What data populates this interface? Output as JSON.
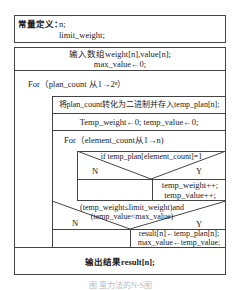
{
  "constants": {
    "label": "常量定义：",
    "line1": "n;",
    "line2": "limit_weight;"
  },
  "main": {
    "input_line1": "输入数组weight[n],value[n];",
    "input_line2": "max_value←0;",
    "outer_loop": "For（plan_count 从1→2ⁿ）",
    "convert": "将plan_count转化为二进制并存入temp_plan[n];",
    "init": "Temp_weight←0; temp_value←0;",
    "inner_loop": "For（element_count从1→n)",
    "cond1": {
      "text": "if temp_plan[element_count]=1",
      "no": "N",
      "yes": "Y",
      "yes_line1": "temp_weight++;",
      "yes_line2": "temp_value++;"
    },
    "cond2": {
      "text_line1": "(temp_weight≤limit_weight)and",
      "text_line2": "(temp_value<max_value)",
      "no": "N",
      "yes": "Y",
      "yes_line1": "result[n]←temp_plan[n];",
      "yes_line2": "max_value←temp_value;"
    },
    "output": "输出结果result[n];"
  },
  "caption": "图  蛮力法的N-S图"
}
